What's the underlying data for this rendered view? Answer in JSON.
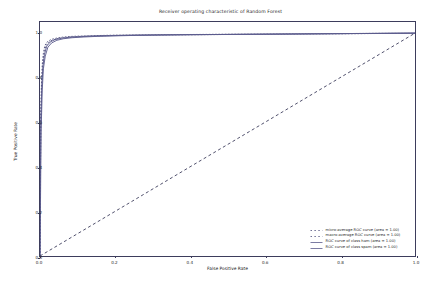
{
  "chart_data": {
    "type": "line",
    "title": "Receiver operating characteristic of Random Forest",
    "xlabel": "False Positive Rate",
    "ylabel": "True Positive Rate",
    "xlim": [
      0.0,
      1.0
    ],
    "ylim": [
      0.0,
      1.05
    ],
    "grid": false,
    "legend_position": "lower right",
    "xticks": [
      "0.0",
      "0.2",
      "0.4",
      "0.6",
      "0.8",
      "1.0"
    ],
    "xtick_values": [
      0.0,
      0.2,
      0.4,
      0.6,
      0.8,
      1.0
    ],
    "yticks": [
      "0.0",
      "0.2",
      "0.4",
      "0.6",
      "0.8",
      "1.0"
    ],
    "ytick_values": [
      0.0,
      0.2,
      0.4,
      0.6,
      0.8,
      1.0
    ],
    "series": [
      {
        "name": "micro-average ROC curve (area = 1.00)",
        "area": 1.0,
        "style": "dotted",
        "color": "#4c4c7a",
        "x": [
          0.0,
          0.002,
          0.004,
          0.006,
          0.009,
          0.013,
          0.02,
          0.03,
          0.045,
          0.06,
          0.08,
          0.11,
          0.15,
          0.2,
          0.26,
          0.33,
          0.41,
          0.5,
          0.6,
          0.7,
          0.8,
          0.9,
          1.0
        ],
        "y": [
          0.0,
          0.62,
          0.78,
          0.86,
          0.91,
          0.945,
          0.962,
          0.972,
          0.978,
          0.982,
          0.985,
          0.987,
          0.989,
          0.991,
          0.992,
          0.993,
          0.994,
          0.995,
          0.996,
          0.997,
          0.998,
          0.999,
          1.0
        ]
      },
      {
        "name": "macro-average ROC curve (area = 1.00)",
        "area": 1.0,
        "style": "dotted",
        "color": "#4c4c7a",
        "x": [
          0.0,
          0.002,
          0.004,
          0.007,
          0.01,
          0.015,
          0.022,
          0.033,
          0.048,
          0.065,
          0.085,
          0.115,
          0.155,
          0.205,
          0.265,
          0.335,
          0.415,
          0.505,
          0.605,
          0.705,
          0.805,
          0.905,
          1.0
        ],
        "y": [
          0.0,
          0.58,
          0.755,
          0.845,
          0.9,
          0.94,
          0.958,
          0.969,
          0.976,
          0.98,
          0.983,
          0.986,
          0.988,
          0.99,
          0.991,
          0.992,
          0.993,
          0.994,
          0.995,
          0.996,
          0.997,
          0.9985,
          1.0
        ]
      },
      {
        "name": "ROC curve of class ham (area = 1.00)",
        "area": 1.0,
        "style": "solid",
        "color": "#5a5a8c",
        "x": [
          0.0,
          0.002,
          0.005,
          0.008,
          0.012,
          0.018,
          0.027,
          0.04,
          0.057,
          0.078,
          0.105,
          0.14,
          0.185,
          0.24,
          0.3,
          0.38,
          0.47,
          0.57,
          0.67,
          0.78,
          0.89,
          1.0
        ],
        "y": [
          0.0,
          0.6,
          0.77,
          0.855,
          0.905,
          0.942,
          0.96,
          0.971,
          0.977,
          0.981,
          0.984,
          0.9865,
          0.9885,
          0.9905,
          0.9918,
          0.993,
          0.994,
          0.9952,
          0.9965,
          0.9978,
          0.999,
          1.0
        ]
      },
      {
        "name": "ROC curve of class spam (area = 1.00)",
        "area": 1.0,
        "style": "solid",
        "color": "#5a5a8c",
        "x": [
          0.0,
          0.003,
          0.006,
          0.009,
          0.014,
          0.021,
          0.031,
          0.045,
          0.063,
          0.086,
          0.115,
          0.152,
          0.2,
          0.258,
          0.325,
          0.405,
          0.495,
          0.595,
          0.695,
          0.8,
          0.9,
          1.0
        ],
        "y": [
          0.0,
          0.565,
          0.745,
          0.84,
          0.897,
          0.937,
          0.956,
          0.968,
          0.975,
          0.9795,
          0.9825,
          0.9855,
          0.9878,
          0.99,
          0.9915,
          0.9928,
          0.994,
          0.995,
          0.9962,
          0.9975,
          0.9988,
          1.0
        ]
      },
      {
        "name": "chance-diagonal",
        "style": "dashed",
        "color": "#3d3d5c",
        "x": [
          0.0,
          1.0
        ],
        "y": [
          0.0,
          1.0
        ]
      }
    ]
  },
  "legend": {
    "entries": [
      {
        "label": "micro-average ROC curve (area = 1.00)",
        "style": "dotted",
        "color": "#4c4c7a"
      },
      {
        "label": "macro-average ROC curve (area = 1.00)",
        "style": "dotted",
        "color": "#4c4c7a"
      },
      {
        "label": "ROC curve of class ham (area = 1.00)",
        "style": "solid",
        "color": "#5a5a8c"
      },
      {
        "label": "ROC curve of class spam (area = 1.00)",
        "style": "solid",
        "color": "#5a5a8c"
      }
    ]
  }
}
